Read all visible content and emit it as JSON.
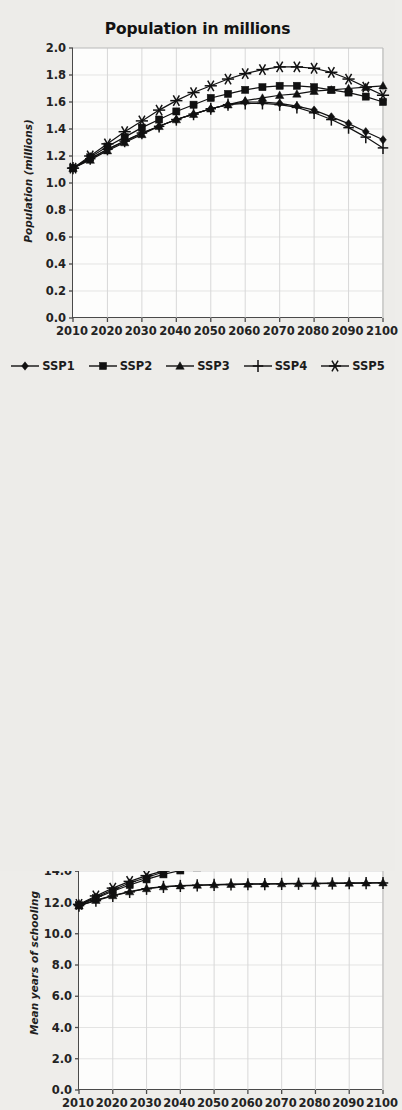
{
  "figure": {
    "background_color": "#edece9",
    "series_color": "#111111",
    "panels": [
      "population",
      "schooling",
      "aging"
    ]
  },
  "legend": {
    "items": [
      {
        "label": "SSP1",
        "marker": "diamond"
      },
      {
        "label": "SSP2",
        "marker": "square"
      },
      {
        "label": "SSP3",
        "marker": "triangle"
      },
      {
        "label": "SSP4",
        "marker": "plus"
      },
      {
        "label": "SSP5",
        "marker": "asterisk"
      }
    ]
  },
  "chart_data": [
    {
      "type": "line",
      "title": "Population in millions",
      "xlabel": "",
      "ylabel": "Population (millions)",
      "x": [
        2010,
        2015,
        2020,
        2025,
        2030,
        2035,
        2040,
        2045,
        2050,
        2055,
        2060,
        2065,
        2070,
        2075,
        2080,
        2085,
        2090,
        2095,
        2100
      ],
      "xlim": [
        2010,
        2100
      ],
      "ylim": [
        0.0,
        2.0
      ],
      "xticks": [
        2010,
        2020,
        2030,
        2040,
        2050,
        2060,
        2070,
        2080,
        2090,
        2100
      ],
      "yticks": [
        0.0,
        0.2,
        0.4,
        0.6,
        0.8,
        1.0,
        1.2,
        1.4,
        1.6,
        1.8,
        2.0
      ],
      "grid": true,
      "legend_position": "below",
      "series": [
        {
          "name": "SSP1",
          "marker": "diamond",
          "values": [
            1.11,
            1.18,
            1.25,
            1.31,
            1.37,
            1.42,
            1.47,
            1.51,
            1.55,
            1.58,
            1.6,
            1.6,
            1.59,
            1.57,
            1.54,
            1.49,
            1.44,
            1.38,
            1.32
          ]
        },
        {
          "name": "SSP2",
          "marker": "square",
          "values": [
            1.11,
            1.19,
            1.27,
            1.34,
            1.41,
            1.47,
            1.53,
            1.58,
            1.63,
            1.66,
            1.69,
            1.71,
            1.72,
            1.72,
            1.71,
            1.69,
            1.67,
            1.64,
            1.6
          ]
        },
        {
          "name": "SSP3",
          "marker": "triangle",
          "values": [
            1.11,
            1.17,
            1.24,
            1.3,
            1.36,
            1.42,
            1.47,
            1.51,
            1.55,
            1.58,
            1.61,
            1.63,
            1.65,
            1.66,
            1.68,
            1.69,
            1.7,
            1.71,
            1.72
          ]
        },
        {
          "name": "SSP4",
          "marker": "plus",
          "values": [
            1.11,
            1.18,
            1.25,
            1.31,
            1.37,
            1.42,
            1.47,
            1.51,
            1.55,
            1.58,
            1.59,
            1.59,
            1.58,
            1.56,
            1.52,
            1.47,
            1.41,
            1.34,
            1.26
          ]
        },
        {
          "name": "SSP5",
          "marker": "asterisk",
          "values": [
            1.11,
            1.2,
            1.29,
            1.38,
            1.46,
            1.54,
            1.61,
            1.67,
            1.72,
            1.77,
            1.81,
            1.84,
            1.86,
            1.86,
            1.85,
            1.82,
            1.77,
            1.71,
            1.65
          ]
        }
      ]
    },
    {
      "type": "line",
      "title": "Mean years of schooling, age 25+",
      "xlabel": "",
      "ylabel": "Mean years of schooling",
      "x": [
        2010,
        2015,
        2020,
        2025,
        2030,
        2035,
        2040,
        2045,
        2050,
        2055,
        2060,
        2065,
        2070,
        2075,
        2080,
        2085,
        2090,
        2095,
        2100
      ],
      "xlim": [
        2010,
        2100
      ],
      "ylim": [
        0.0,
        16.0
      ],
      "xticks": [
        2010,
        2020,
        2030,
        2040,
        2050,
        2060,
        2070,
        2080,
        2090,
        2100
      ],
      "yticks": [
        0.0,
        2.0,
        4.0,
        6.0,
        8.0,
        10.0,
        12.0,
        14.0,
        16.0
      ],
      "grid": true,
      "legend_position": "none",
      "series": [
        {
          "name": "SSP1",
          "marker": "diamond",
          "values": [
            11.85,
            12.35,
            12.8,
            13.25,
            13.6,
            13.95,
            14.2,
            14.4,
            14.55,
            14.68,
            14.78,
            14.86,
            14.94,
            15.0,
            15.05,
            15.09,
            15.12,
            15.14,
            15.16
          ]
        },
        {
          "name": "SSP2",
          "marker": "square",
          "values": [
            11.82,
            12.28,
            12.72,
            13.12,
            13.48,
            13.8,
            14.05,
            14.25,
            14.42,
            14.55,
            14.66,
            14.76,
            14.84,
            14.91,
            14.97,
            15.02,
            15.05,
            15.08,
            15.1
          ]
        },
        {
          "name": "SSP3",
          "marker": "triangle",
          "values": [
            11.8,
            12.15,
            12.45,
            12.7,
            12.9,
            13.02,
            13.08,
            13.12,
            13.15,
            13.17,
            13.19,
            13.2,
            13.21,
            13.22,
            13.23,
            13.24,
            13.25,
            13.26,
            13.27
          ]
        },
        {
          "name": "SSP4",
          "marker": "plus",
          "values": [
            11.8,
            12.12,
            12.42,
            12.68,
            12.88,
            13.0,
            13.06,
            13.1,
            13.13,
            13.15,
            13.17,
            13.18,
            13.19,
            13.2,
            13.21,
            13.22,
            13.23,
            13.24,
            13.25
          ]
        },
        {
          "name": "SSP5",
          "marker": "asterisk",
          "values": [
            11.88,
            12.42,
            12.92,
            13.35,
            13.72,
            14.02,
            14.26,
            14.45,
            14.6,
            14.72,
            14.82,
            14.9,
            14.97,
            15.03,
            15.08,
            15.11,
            15.14,
            15.16,
            15.18
          ]
        }
      ]
    },
    {
      "type": "line",
      "title": "Proportion age 65+",
      "xlabel": "",
      "ylabel": "",
      "x": [
        2010,
        2015,
        2020,
        2025,
        2030,
        2035,
        2040,
        2045,
        2050,
        2055,
        2060,
        2065,
        2070,
        2075,
        2080,
        2085,
        2090,
        2095,
        2100
      ],
      "xlim": [
        2010,
        2100
      ],
      "ylim": [
        0.0,
        0.7
      ],
      "xticks": [
        2010,
        2020,
        2030,
        2040,
        2050,
        2060,
        2070,
        2080,
        2090,
        2100
      ],
      "yticks": [
        0.6,
        0.7
      ],
      "grid": true,
      "legend_position": "none",
      "clipped": true,
      "series": [
        {
          "name": "SSP1",
          "marker": "diamond",
          "values": [
            0.09,
            0.1,
            0.12,
            0.14,
            0.17,
            0.2,
            0.23,
            0.26,
            0.3,
            0.34,
            0.38,
            0.42,
            0.46,
            0.5,
            0.53,
            0.56,
            0.58,
            0.59,
            0.6
          ]
        },
        {
          "name": "SSP2",
          "marker": "square",
          "values": [
            0.09,
            0.1,
            0.12,
            0.14,
            0.16,
            0.19,
            0.22,
            0.25,
            0.28,
            0.32,
            0.36,
            0.4,
            0.43,
            0.47,
            0.5,
            0.53,
            0.55,
            0.57,
            0.58
          ]
        },
        {
          "name": "SSP3",
          "marker": "triangle",
          "values": [
            0.09,
            0.1,
            0.11,
            0.13,
            0.16,
            0.18,
            0.21,
            0.24,
            0.27,
            0.3,
            0.33,
            0.36,
            0.39,
            0.42,
            0.45,
            0.48,
            0.5,
            0.52,
            0.54
          ]
        },
        {
          "name": "SSP4",
          "marker": "plus",
          "values": [
            0.09,
            0.1,
            0.12,
            0.14,
            0.16,
            0.19,
            0.22,
            0.25,
            0.29,
            0.32,
            0.36,
            0.4,
            0.44,
            0.48,
            0.51,
            0.54,
            0.56,
            0.58,
            0.59
          ]
        },
        {
          "name": "SSP5",
          "marker": "asterisk",
          "values": [
            0.09,
            0.1,
            0.12,
            0.14,
            0.17,
            0.2,
            0.23,
            0.27,
            0.3,
            0.34,
            0.38,
            0.42,
            0.46,
            0.5,
            0.54,
            0.57,
            0.59,
            0.6,
            0.61
          ]
        }
      ]
    }
  ]
}
